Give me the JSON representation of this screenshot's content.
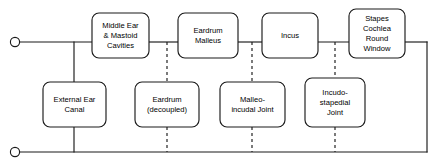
{
  "diagram": {
    "colors": {
      "line": "#1a1a1a",
      "box_fill": "#ffffff",
      "background": "#ffffff"
    },
    "terminals": [
      {
        "name": "input-terminal-top",
        "cx": 15,
        "cy": 42,
        "r": 4.6
      },
      {
        "name": "input-terminal-bottom",
        "cx": 15,
        "cy": 152,
        "r": 4.6
      }
    ],
    "series_nodes": [
      {
        "id": "middle-ear-mastoid-cavities",
        "lines": [
          "Middle Ear",
          "& Mastoid",
          "Cavities"
        ],
        "x": 92,
        "y": 13,
        "w": 57,
        "h": 45
      },
      {
        "id": "eardrum-malleus",
        "lines": [
          "Eardrum",
          "Malleus"
        ],
        "x": 178,
        "y": 13,
        "w": 60,
        "h": 45
      },
      {
        "id": "incus",
        "lines": [
          "Incus"
        ],
        "x": 262,
        "y": 13,
        "w": 56,
        "h": 45
      },
      {
        "id": "stapes-cochlea-round-window",
        "lines": [
          "Stapes",
          "Cochlea",
          "Round",
          "Window"
        ],
        "x": 349,
        "y": 9,
        "w": 56,
        "h": 49
      }
    ],
    "shunt_nodes": [
      {
        "id": "external-ear-canal",
        "lines": [
          "External Ear",
          "Canal"
        ],
        "x": 43,
        "y": 82,
        "w": 63,
        "h": 45
      },
      {
        "id": "eardrum-decoupled",
        "lines": [
          "Eardrum",
          "(decoupled)"
        ],
        "x": 135,
        "y": 82,
        "w": 64,
        "h": 45
      },
      {
        "id": "malleo-incudal-joint",
        "lines": [
          "Malleo-",
          "incudal Joint"
        ],
        "x": 220,
        "y": 82,
        "w": 65,
        "h": 45
      },
      {
        "id": "incudo-stapedial-joint",
        "lines": [
          "Incudo-",
          "stapedial",
          "Joint"
        ],
        "x": 305,
        "y": 78,
        "w": 60,
        "h": 49
      }
    ],
    "rails": {
      "top_y": 42,
      "bottom_y": 152,
      "left_x": 19,
      "right_x": 427
    },
    "connectors": {
      "solid_branch_x": 74,
      "dashed_branch_x": [
        167,
        252,
        335
      ]
    }
  }
}
